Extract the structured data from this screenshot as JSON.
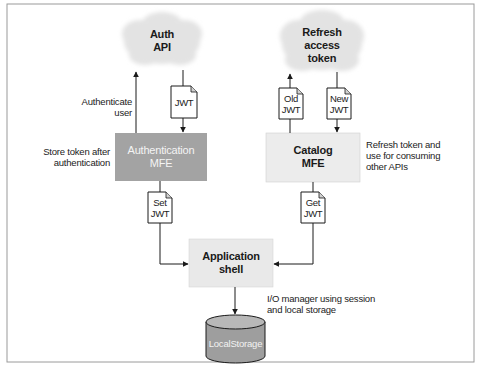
{
  "diagram": {
    "colors": {
      "frame": "#9a9a9a",
      "cloud": "#e6e6e6",
      "auth_mfe_fill": "#a3a3a3",
      "catalog_mfe_fill": "#ececec",
      "shell_fill": "#e9e9e9",
      "storage_fill": "#9e9e9e",
      "storage_top": "#b8b8b8",
      "line": "#1a1a1a"
    },
    "nodes": {
      "auth_api": {
        "line1": "Auth",
        "line2": "API"
      },
      "refresh_token": {
        "line1": "Refresh",
        "line2": "access",
        "line3": "token"
      },
      "auth_mfe": {
        "line1": "Authentication",
        "line2": "MFE"
      },
      "catalog_mfe": {
        "line1": "Catalog",
        "line2": "MFE"
      },
      "app_shell": {
        "line1": "Application",
        "line2": "shell"
      },
      "local_storage": {
        "label": "LocalStorage"
      }
    },
    "documents": {
      "jwt": {
        "line1": "JWT"
      },
      "old_jwt": {
        "line1": "Old",
        "line2": "JWT"
      },
      "new_jwt": {
        "line1": "New",
        "line2": "JWT"
      },
      "set_jwt": {
        "line1": "Set",
        "line2": "JWT"
      },
      "get_jwt": {
        "line1": "Get",
        "line2": "JWT"
      }
    },
    "annotations": {
      "authenticate_user": {
        "line1": "Authenticate",
        "line2": "user"
      },
      "store_token": {
        "line1": "Store token after",
        "line2": "authentication"
      },
      "refresh_use": {
        "line1": "Refresh token and",
        "line2": "use for consuming",
        "line3": "other APIs"
      },
      "io_manager": {
        "line1": "I/O manager using session",
        "line2": "and local storage"
      }
    }
  }
}
